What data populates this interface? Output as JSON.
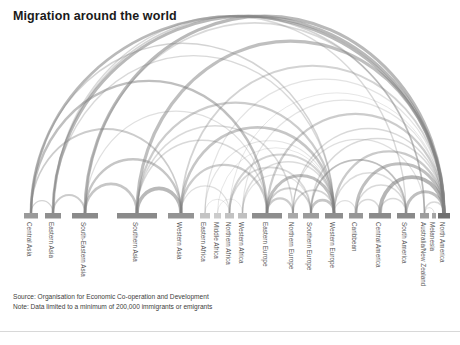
{
  "header": {
    "title": "Migration around the world"
  },
  "footer": {
    "source": "Source: Organisation for Economic Co-operation and Development",
    "note": "Note: Data limited to a minimum of 200,000 immigrants or emigrants"
  },
  "colors": {
    "background": "#ffffff",
    "title": "#1a1a1a",
    "arc": "#808080",
    "node": "#8c8c8c",
    "node_dark": "#6e6e6e",
    "node_light": "#c9c9c9",
    "label": "#555555",
    "rule": "#d8d8d8"
  },
  "chart_data": {
    "type": "chord",
    "title": "Migration around the world",
    "xlabel": "",
    "ylabel": "",
    "grid": false,
    "legend": "none",
    "baseline_y": 213,
    "categories": [
      "Central Asia",
      "Eastern Asia",
      "South-Eastern Asia",
      "Southern Asia",
      "Western Asia",
      "Eastern Africa",
      "Middle Africa",
      "Northern Africa",
      "Western Africa",
      "Eastern Europe",
      "Northern Europe",
      "Southern Europe",
      "Western Europe",
      "Caribbean",
      "Central America",
      "South America",
      "Australia/New Zealand",
      "Melanesia",
      "North America"
    ],
    "nodes": [
      {
        "label": "Central Asia",
        "x": 24,
        "width": 14,
        "weight": 1.6,
        "shade": "#9a9a9a"
      },
      {
        "label": "Eastern Asia",
        "x": 45,
        "width": 16,
        "weight": 2.2,
        "shade": "#8f8f8f"
      },
      {
        "label": "South-Eastern Asia",
        "x": 72,
        "width": 26,
        "weight": 3.6,
        "shade": "#8a8a8a"
      },
      {
        "label": "Southern Asia",
        "x": 117,
        "width": 40,
        "weight": 5.4,
        "shade": "#8a8a8a"
      },
      {
        "label": "Western Asia",
        "x": 168,
        "width": 26,
        "weight": 3.4,
        "shade": "#949494"
      },
      {
        "label": "Eastern Africa",
        "x": 200,
        "width": 10,
        "weight": 1.1,
        "shade": "#c4c4c4"
      },
      {
        "label": "Middle Africa",
        "x": 214,
        "width": 7,
        "weight": 0.7,
        "shade": "#cccccc"
      },
      {
        "label": "Northern Africa",
        "x": 225,
        "width": 9,
        "weight": 1.0,
        "shade": "#c2c2c2"
      },
      {
        "label": "Western Africa",
        "x": 238,
        "width": 9,
        "weight": 1.0,
        "shade": "#c0c0c0"
      },
      {
        "label": "Eastern Europe",
        "x": 252,
        "width": 30,
        "weight": 4.2,
        "shade": "#8d8d8d"
      },
      {
        "label": "Northern Europe",
        "x": 288,
        "width": 10,
        "weight": 1.2,
        "shade": "#a8a8a8"
      },
      {
        "label": "Southern Europe",
        "x": 303,
        "width": 16,
        "weight": 2.2,
        "shade": "#9b9b9b"
      },
      {
        "label": "Western Europe",
        "x": 325,
        "width": 18,
        "weight": 2.4,
        "shade": "#8e8e8e"
      },
      {
        "label": "Caribbean",
        "x": 349,
        "width": 14,
        "weight": 1.9,
        "shade": "#979797"
      },
      {
        "label": "Central America",
        "x": 369,
        "width": 22,
        "weight": 3.0,
        "shade": "#8b8b8b"
      },
      {
        "label": "South America",
        "x": 397,
        "width": 18,
        "weight": 2.5,
        "shade": "#8a8a8a"
      },
      {
        "label": "Australia/New Zealand",
        "x": 420,
        "width": 9,
        "weight": 1.0,
        "shade": "#9d9d9d"
      },
      {
        "label": "Melanesia",
        "x": 432,
        "width": 4,
        "weight": 0.4,
        "shade": "#a5a5a5"
      },
      {
        "label": "North America",
        "x": 438,
        "width": 12,
        "weight": 1.7,
        "shade": "#6f6f6f"
      }
    ],
    "flows": [
      {
        "from": "Central Asia",
        "to": "North America",
        "value": 11,
        "width": 2.6,
        "opacity": 0.55
      },
      {
        "from": "Central Asia",
        "to": "Eastern Europe",
        "value": 9,
        "width": 2.4,
        "opacity": 0.5
      },
      {
        "from": "Central Asia",
        "to": "Western Asia",
        "value": 6,
        "width": 1.8,
        "opacity": 0.4
      },
      {
        "from": "Central Asia",
        "to": "Western Europe",
        "value": 5,
        "width": 1.5,
        "opacity": 0.35
      },
      {
        "from": "Central Asia",
        "to": "Eastern Asia",
        "value": 4,
        "width": 1.2,
        "opacity": 0.35
      },
      {
        "from": "Eastern Asia",
        "to": "North America",
        "value": 14,
        "width": 3.0,
        "opacity": 0.55
      },
      {
        "from": "Eastern Asia",
        "to": "South America",
        "value": 5,
        "width": 1.4,
        "opacity": 0.3
      },
      {
        "from": "Eastern Asia",
        "to": "Australia/New Zealand",
        "value": 6,
        "width": 1.6,
        "opacity": 0.35
      },
      {
        "from": "Eastern Asia",
        "to": "South-Eastern Asia",
        "value": 7,
        "width": 2.0,
        "opacity": 0.4
      },
      {
        "from": "Eastern Asia",
        "to": "Western Europe",
        "value": 5,
        "width": 1.4,
        "opacity": 0.3
      },
      {
        "from": "South-Eastern Asia",
        "to": "North America",
        "value": 16,
        "width": 3.2,
        "opacity": 0.55
      },
      {
        "from": "South-Eastern Asia",
        "to": "Southern Asia",
        "value": 10,
        "width": 2.6,
        "opacity": 0.45
      },
      {
        "from": "South-Eastern Asia",
        "to": "Western Asia",
        "value": 9,
        "width": 2.4,
        "opacity": 0.45
      },
      {
        "from": "South-Eastern Asia",
        "to": "Australia/New Zealand",
        "value": 6,
        "width": 1.6,
        "opacity": 0.3
      },
      {
        "from": "South-Eastern Asia",
        "to": "Eastern Europe",
        "value": 4,
        "width": 1.2,
        "opacity": 0.25
      },
      {
        "from": "Southern Asia",
        "to": "North America",
        "value": 15,
        "width": 3.2,
        "opacity": 0.5
      },
      {
        "from": "Southern Asia",
        "to": "Western Asia",
        "value": 18,
        "width": 3.6,
        "opacity": 0.55
      },
      {
        "from": "Southern Asia",
        "to": "Western Europe",
        "value": 8,
        "width": 2.2,
        "opacity": 0.4
      },
      {
        "from": "Southern Asia",
        "to": "Northern Europe",
        "value": 5,
        "width": 1.5,
        "opacity": 0.3
      },
      {
        "from": "Southern Asia",
        "to": "Eastern Europe",
        "value": 5,
        "width": 1.4,
        "opacity": 0.3
      },
      {
        "from": "Western Asia",
        "to": "Western Europe",
        "value": 12,
        "width": 2.8,
        "opacity": 0.45
      },
      {
        "from": "Western Asia",
        "to": "Eastern Europe",
        "value": 8,
        "width": 2.2,
        "opacity": 0.4
      },
      {
        "from": "Western Asia",
        "to": "North America",
        "value": 7,
        "width": 1.8,
        "opacity": 0.35
      },
      {
        "from": "Western Asia",
        "to": "Northern Africa",
        "value": 4,
        "width": 1.2,
        "opacity": 0.25
      },
      {
        "from": "Eastern Africa",
        "to": "Western Europe",
        "value": 4,
        "width": 1.2,
        "opacity": 0.22
      },
      {
        "from": "Eastern Africa",
        "to": "North America",
        "value": 4,
        "width": 1.2,
        "opacity": 0.22
      },
      {
        "from": "Eastern Africa",
        "to": "Northern Africa",
        "value": 3,
        "width": 1.0,
        "opacity": 0.2
      },
      {
        "from": "Middle Africa",
        "to": "Western Europe",
        "value": 3,
        "width": 1.0,
        "opacity": 0.2
      },
      {
        "from": "Middle Africa",
        "to": "Western Africa",
        "value": 2,
        "width": 0.9,
        "opacity": 0.18
      },
      {
        "from": "Northern Africa",
        "to": "Western Europe",
        "value": 9,
        "width": 2.2,
        "opacity": 0.35
      },
      {
        "from": "Northern Africa",
        "to": "Southern Europe",
        "value": 7,
        "width": 1.8,
        "opacity": 0.3
      },
      {
        "from": "Northern Africa",
        "to": "North America",
        "value": 3,
        "width": 1.0,
        "opacity": 0.2
      },
      {
        "from": "Western Africa",
        "to": "Western Europe",
        "value": 6,
        "width": 1.6,
        "opacity": 0.28
      },
      {
        "from": "Western Africa",
        "to": "Southern Europe",
        "value": 4,
        "width": 1.2,
        "opacity": 0.22
      },
      {
        "from": "Western Africa",
        "to": "North America",
        "value": 4,
        "width": 1.2,
        "opacity": 0.22
      },
      {
        "from": "Eastern Europe",
        "to": "Western Europe",
        "value": 16,
        "width": 3.2,
        "opacity": 0.5
      },
      {
        "from": "Eastern Europe",
        "to": "Northern Europe",
        "value": 9,
        "width": 2.2,
        "opacity": 0.4
      },
      {
        "from": "Eastern Europe",
        "to": "Southern Europe",
        "value": 8,
        "width": 2.0,
        "opacity": 0.38
      },
      {
        "from": "Eastern Europe",
        "to": "North America",
        "value": 9,
        "width": 2.2,
        "opacity": 0.4
      },
      {
        "from": "Northern Europe",
        "to": "Western Europe",
        "value": 7,
        "width": 1.8,
        "opacity": 0.35
      },
      {
        "from": "Northern Europe",
        "to": "North America",
        "value": 5,
        "width": 1.5,
        "opacity": 0.3
      },
      {
        "from": "Northern Europe",
        "to": "Australia/New Zealand",
        "value": 4,
        "width": 1.2,
        "opacity": 0.25
      },
      {
        "from": "Southern Europe",
        "to": "Western Europe",
        "value": 11,
        "width": 2.6,
        "opacity": 0.45
      },
      {
        "from": "Southern Europe",
        "to": "North America",
        "value": 6,
        "width": 1.6,
        "opacity": 0.3
      },
      {
        "from": "Southern Europe",
        "to": "South America",
        "value": 5,
        "width": 1.5,
        "opacity": 0.28
      },
      {
        "from": "Western Europe",
        "to": "North America",
        "value": 10,
        "width": 2.4,
        "opacity": 0.42
      },
      {
        "from": "Western Europe",
        "to": "South America",
        "value": 5,
        "width": 1.5,
        "opacity": 0.28
      },
      {
        "from": "Western Europe",
        "to": "Caribbean",
        "value": 4,
        "width": 1.2,
        "opacity": 0.25
      },
      {
        "from": "Caribbean",
        "to": "North America",
        "value": 14,
        "width": 3.0,
        "opacity": 0.5
      },
      {
        "from": "Caribbean",
        "to": "Central America",
        "value": 5,
        "width": 1.5,
        "opacity": 0.3
      },
      {
        "from": "Caribbean",
        "to": "South America",
        "value": 5,
        "width": 1.5,
        "opacity": 0.3
      },
      {
        "from": "Central America",
        "to": "North America",
        "value": 20,
        "width": 3.8,
        "opacity": 0.58
      },
      {
        "from": "Central America",
        "to": "South America",
        "value": 6,
        "width": 1.6,
        "opacity": 0.3
      },
      {
        "from": "South America",
        "to": "North America",
        "value": 14,
        "width": 3.0,
        "opacity": 0.5
      },
      {
        "from": "South America",
        "to": "Southern Europe",
        "value": 7,
        "width": 1.8,
        "opacity": 0.32
      },
      {
        "from": "Australia/New Zealand",
        "to": "North America",
        "value": 5,
        "width": 1.5,
        "opacity": 0.3
      },
      {
        "from": "Melanesia",
        "to": "Australia/New Zealand",
        "value": 3,
        "width": 1.0,
        "opacity": 0.25
      }
    ]
  }
}
